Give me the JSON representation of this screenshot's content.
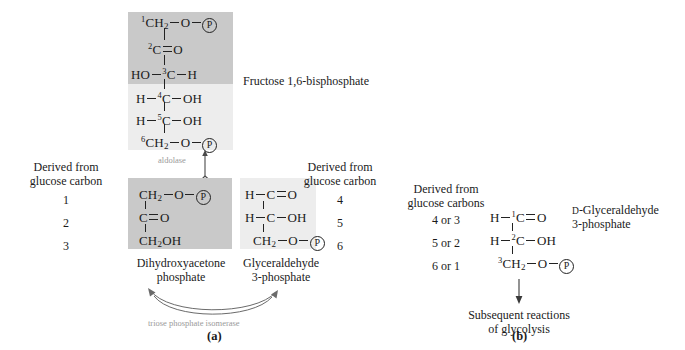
{
  "figure": {
    "panel_a_label": "(a)",
    "panel_b_label": "(b)"
  },
  "panel_a": {
    "fbp": {
      "name": "Fructose 1,6-bisphosphate",
      "rows": [
        {
          "carbon": "1",
          "left": "",
          "center": "CH2",
          "right": "O",
          "terminal": "P"
        },
        {
          "carbon": "2",
          "left": "",
          "center": "C",
          "right": "O",
          "terminal": ""
        },
        {
          "carbon": "3",
          "left": "HO",
          "center": "C",
          "right": "H",
          "terminal": ""
        },
        {
          "carbon": "4",
          "left": "H",
          "center": "C",
          "right": "OH",
          "terminal": ""
        },
        {
          "carbon": "5",
          "left": "H",
          "center": "C",
          "right": "OH",
          "terminal": ""
        },
        {
          "carbon": "6",
          "left": "",
          "center": "CH2",
          "right": "O",
          "terminal": "P"
        }
      ],
      "phosphate_glyph": "P"
    },
    "enzyme_aldolase": "aldolase",
    "enzyme_isomerase": "triose phosphate isomerase",
    "left_legend": {
      "line1": "Derived from",
      "line2": "glucose carbon",
      "numbers": [
        "1",
        "2",
        "3"
      ]
    },
    "right_legend": {
      "line1": "Derived from",
      "line2": "glucose carbon",
      "numbers": [
        "4",
        "5",
        "6"
      ]
    },
    "dhap": {
      "name_line1": "Dihydroxyacetone",
      "name_line2": "phosphate",
      "rows": [
        {
          "center": "CH2",
          "right": "O",
          "terminal": "P"
        },
        {
          "center": "C",
          "right": "O",
          "terminal": ""
        },
        {
          "center": "CH2OH",
          "right": "",
          "terminal": ""
        }
      ]
    },
    "gap": {
      "name_line1": "Glyceraldehyde",
      "name_line2": "3-phosphate",
      "rows": [
        {
          "left": "H",
          "center": "C",
          "right": "O",
          "terminal": ""
        },
        {
          "left": "H",
          "center": "C",
          "right": "OH",
          "terminal": ""
        },
        {
          "left": "",
          "center": "CH2",
          "right": "O",
          "terminal": "P"
        }
      ]
    }
  },
  "panel_b": {
    "legend": {
      "line1": "Derived from",
      "line2": "glucose carbons",
      "numbers": [
        "4 or 3",
        "5 or 2",
        "6 or 1"
      ]
    },
    "g3p": {
      "name_prefix": "D",
      "name_line1": "-Glyceraldehyde",
      "name_line2": "3-phosphate",
      "rows": [
        {
          "left": "H",
          "carbon": "1",
          "center": "C",
          "right": "O",
          "terminal": ""
        },
        {
          "left": "H",
          "carbon": "2",
          "center": "C",
          "right": "OH",
          "terminal": ""
        },
        {
          "left": "",
          "carbon": "3",
          "center": "CH2",
          "right": "O",
          "terminal": "P"
        }
      ]
    },
    "outcome_line1": "Subsequent reactions",
    "outcome_line2": "of glycolysis"
  },
  "colors": {
    "shade_dark": "#c9c9c9",
    "shade_light": "#ededed",
    "enzyme_text": "#9a9a9a",
    "ink": "#1a1a1a"
  }
}
